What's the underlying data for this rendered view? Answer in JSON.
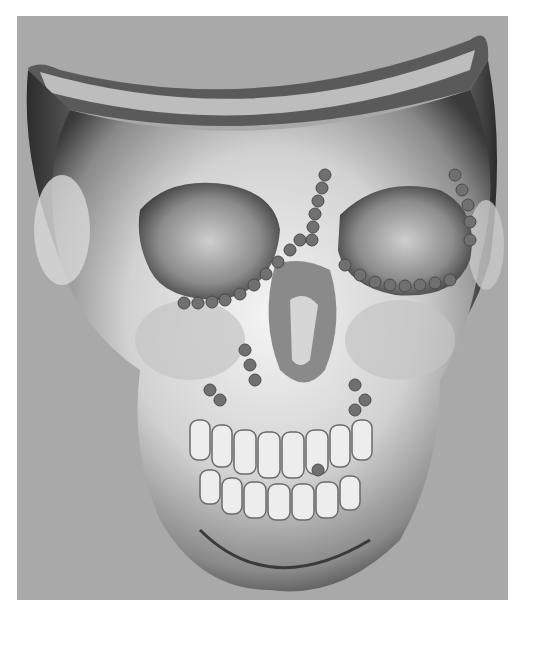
{
  "image": {
    "subject": "3D CT reconstruction of a human skull with fixation plates and screws",
    "background_color": "#a9a9a9",
    "border_color": "#ffffff",
    "bone_color": "#e6e6e6",
    "shadow_color": "#2e2e2e",
    "plate_color": "#6e6e6e",
    "text_labels": []
  }
}
